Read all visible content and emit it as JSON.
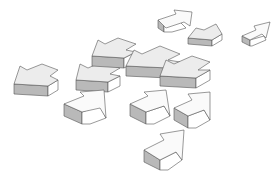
{
  "illustration": {
    "subject": "scattered 3D arrows",
    "background_color": "#ffffff",
    "colors": {
      "face_light": "#ececec",
      "face_white": "#fafafa",
      "face_dark": "#b9b9b9",
      "outline": "#555555"
    },
    "arrows": [
      {
        "id": "left-far",
        "direction": "left"
      },
      {
        "id": "left-mid-1",
        "direction": "left"
      },
      {
        "id": "left-mid-2",
        "direction": "left"
      },
      {
        "id": "center-left-1",
        "direction": "left"
      },
      {
        "id": "center-left-2",
        "direction": "left"
      },
      {
        "id": "top-right-up",
        "direction": "up-right"
      },
      {
        "id": "top-center-up",
        "direction": "up-right"
      },
      {
        "id": "right-small",
        "direction": "up-right"
      },
      {
        "id": "upright-1",
        "direction": "up-right"
      },
      {
        "id": "upright-2",
        "direction": "up-right"
      },
      {
        "id": "upright-3",
        "direction": "up-right"
      },
      {
        "id": "upright-bottom",
        "direction": "up-right"
      }
    ]
  }
}
